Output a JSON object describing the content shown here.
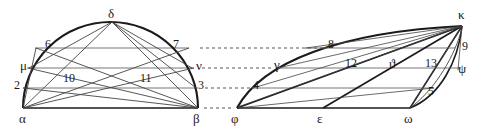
{
  "figure": {
    "stroke_color": "#1a1a1a",
    "thin_color": "#555555",
    "dotted_color": "#444444",
    "background": "#ffffff",
    "left_shape": {
      "name": "semicircle",
      "vertices": {
        "alpha": {
          "label": "α",
          "x": 23,
          "y": 108
        },
        "beta": {
          "label": "β",
          "x": 198,
          "y": 108
        },
        "delta": {
          "label": "δ",
          "x": 112,
          "y": 22
        },
        "mu": {
          "label": "μ",
          "x": 30,
          "y": 68
        },
        "nu": {
          "label": "ν",
          "x": 191,
          "y": 68
        }
      },
      "chord_levels": [
        48,
        68,
        88,
        108
      ]
    },
    "right_shape": {
      "name": "parallelogram",
      "vertices": {
        "phi": {
          "label": "φ",
          "x": 237,
          "y": 108
        },
        "epsilon": {
          "label": "ε",
          "x": 323,
          "y": 108
        },
        "omega": {
          "label": "ω",
          "x": 410,
          "y": 108
        },
        "kappa": {
          "label": "κ",
          "x": 462,
          "y": 26
        },
        "gamma": {
          "label": "γ",
          "x": 280,
          "y": 66
        },
        "psi": {
          "label": "ψ",
          "x": 463,
          "y": 70
        },
        "theta": {
          "label": "ϑ",
          "x": 392,
          "y": 64
        }
      },
      "chord_levels": [
        48,
        68,
        88,
        108
      ]
    },
    "labels": [
      {
        "id": "label-delta",
        "text": "δ",
        "x": 108,
        "y": 7,
        "kind": "greek"
      },
      {
        "id": "label-6",
        "text": "6",
        "x": 45,
        "y": 38,
        "kind": "num"
      },
      {
        "id": "label-7",
        "text": "7",
        "x": 173,
        "y": 38,
        "kind": "num"
      },
      {
        "id": "label-mu",
        "text": "μ",
        "x": 20,
        "y": 59,
        "kind": "greek"
      },
      {
        "id": "label-nu",
        "text": "ν",
        "x": 196,
        "y": 59,
        "kind": "greek"
      },
      {
        "id": "label-10",
        "text": "10",
        "x": 63,
        "y": 72,
        "kind": "num"
      },
      {
        "id": "label-11",
        "text": "11",
        "x": 140,
        "y": 72,
        "kind": "num"
      },
      {
        "id": "label-2",
        "text": "2",
        "x": 14,
        "y": 79,
        "kind": "num"
      },
      {
        "id": "label-3",
        "text": "3",
        "x": 198,
        "y": 79,
        "kind": "num"
      },
      {
        "id": "label-alpha",
        "text": "α",
        "x": 19,
        "y": 113,
        "kind": "greek"
      },
      {
        "id": "label-beta",
        "text": "β",
        "x": 193,
        "y": 113,
        "kind": "greek"
      },
      {
        "id": "label-kappa",
        "text": "κ",
        "x": 458,
        "y": 8,
        "kind": "greek"
      },
      {
        "id": "label-8",
        "text": "8",
        "x": 328,
        "y": 38,
        "kind": "num"
      },
      {
        "id": "label-9",
        "text": "9",
        "x": 462,
        "y": 40,
        "kind": "num"
      },
      {
        "id": "label-gamma",
        "text": "γ",
        "x": 276,
        "y": 59,
        "kind": "greek"
      },
      {
        "id": "label-12",
        "text": "12",
        "x": 345,
        "y": 58,
        "kind": "num"
      },
      {
        "id": "label-theta",
        "text": "ϑ",
        "x": 389,
        "y": 58,
        "kind": "greek"
      },
      {
        "id": "label-13",
        "text": "13",
        "x": 425,
        "y": 58,
        "kind": "num"
      },
      {
        "id": "label-psi",
        "text": "ψ",
        "x": 459,
        "y": 62,
        "kind": "greek"
      },
      {
        "id": "label-4",
        "text": "4",
        "x": 253,
        "y": 79,
        "kind": "num"
      },
      {
        "id": "label-5",
        "text": "5",
        "x": 428,
        "y": 86,
        "kind": "num"
      },
      {
        "id": "label-phi",
        "text": "φ",
        "x": 232,
        "y": 112,
        "kind": "greek"
      },
      {
        "id": "label-epsilon",
        "text": "ε",
        "x": 318,
        "y": 113,
        "kind": "greek"
      },
      {
        "id": "label-omega",
        "text": "ω",
        "x": 405,
        "y": 113,
        "kind": "greek"
      }
    ],
    "connector_lines": [
      {
        "id": "connector-7-8",
        "from_y": 48,
        "x1": 200,
        "x2": 325
      },
      {
        "id": "connector-nu-gamma",
        "from_y": 68,
        "x1": 200,
        "x2": 275
      },
      {
        "id": "connector-3-4",
        "from_y": 88,
        "x1": 202,
        "x2": 250
      },
      {
        "id": "connector-beta-phi",
        "from_y": 108,
        "x1": 202,
        "x2": 232
      }
    ]
  }
}
